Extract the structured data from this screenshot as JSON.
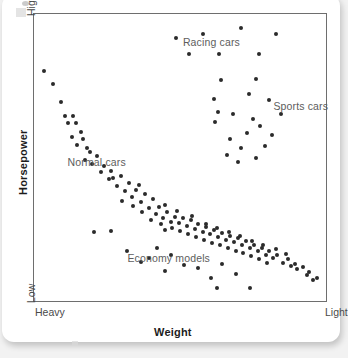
{
  "figure": {
    "caption_title": "Weight",
    "axis_titles": {
      "x": "Weight",
      "y": "Horsepower"
    },
    "axis_ends": {
      "x_left": "Heavy",
      "x_right": "Light",
      "y_top": "High",
      "y_bottom": "Low"
    }
  },
  "chart_data": {
    "type": "scatter",
    "title": "",
    "xlabel": "Weight",
    "ylabel": "Horsepower",
    "xlim": [
      0,
      100
    ],
    "ylim": [
      0,
      100
    ],
    "x_axis_direction": "Heavy (left) to Light (right)",
    "y_axis_direction": "Low (bottom) to High (top)",
    "x_tick_labels": [
      "Heavy",
      "Light"
    ],
    "y_tick_labels": [
      "Low",
      "High"
    ],
    "grid": false,
    "legend": "none",
    "annotations": [
      {
        "text": "Racing cars",
        "x": 51.0,
        "y": 90.0
      },
      {
        "text": "Sports cars",
        "x": 82.0,
        "y": 67.5
      },
      {
        "text": "Normal cars",
        "x": 11.5,
        "y": 48.0
      },
      {
        "text": "Economy models",
        "x": 32.0,
        "y": 14.5
      }
    ],
    "series": [
      {
        "name": "Normal cars",
        "comment": "Dense negatively-sloped diagonal band from heavy/high to light/low",
        "points": [
          [
            3.4,
            80.3
          ],
          [
            6.5,
            75.6
          ],
          [
            9.2,
            69.2
          ],
          [
            10.5,
            64.4
          ],
          [
            11.6,
            61.9
          ],
          [
            13.3,
            64.4
          ],
          [
            14.2,
            61.9
          ],
          [
            13.1,
            57.1
          ],
          [
            14.6,
            54.2
          ],
          [
            16.7,
            56.5
          ],
          [
            19.0,
            51.9
          ],
          [
            17.4,
            49.0
          ],
          [
            20.0,
            47.8
          ],
          [
            21.5,
            50.4
          ],
          [
            22.9,
            45.0
          ],
          [
            24.0,
            47.0
          ],
          [
            25.5,
            42.5
          ],
          [
            26.4,
            45.2
          ],
          [
            28.4,
            40.0
          ],
          [
            29.8,
            43.6
          ],
          [
            31.1,
            38.3
          ],
          [
            32.4,
            41.0
          ],
          [
            30.0,
            35.0
          ],
          [
            33.5,
            36.2
          ],
          [
            35.0,
            38.8
          ],
          [
            34.0,
            33.0
          ],
          [
            36.6,
            34.5
          ],
          [
            38.1,
            37.2
          ],
          [
            37.0,
            31.0
          ],
          [
            39.2,
            32.5
          ],
          [
            40.6,
            35.4
          ],
          [
            41.8,
            30.2
          ],
          [
            39.9,
            28.4
          ],
          [
            42.9,
            32.9
          ],
          [
            44.2,
            29.1
          ],
          [
            43.4,
            26.7
          ],
          [
            45.6,
            31.0
          ],
          [
            46.9,
            27.6
          ],
          [
            45.0,
            24.9
          ],
          [
            48.2,
            29.4
          ],
          [
            47.4,
            25.6
          ],
          [
            49.5,
            27.1
          ],
          [
            50.9,
            29.0
          ],
          [
            50.1,
            24.4
          ],
          [
            52.3,
            26.0
          ],
          [
            53.6,
            28.1
          ],
          [
            52.8,
            23.3
          ],
          [
            55.0,
            25.2
          ],
          [
            56.3,
            26.9
          ],
          [
            55.4,
            22.2
          ],
          [
            57.7,
            24.1
          ],
          [
            59.0,
            25.9
          ],
          [
            58.2,
            21.3
          ],
          [
            60.4,
            23.2
          ],
          [
            61.7,
            24.8
          ],
          [
            60.9,
            20.4
          ],
          [
            63.1,
            22.3
          ],
          [
            64.4,
            23.8
          ],
          [
            63.6,
            19.6
          ],
          [
            65.8,
            21.4
          ],
          [
            67.1,
            22.8
          ],
          [
            66.3,
            18.5
          ],
          [
            68.5,
            20.5
          ],
          [
            69.8,
            21.8
          ],
          [
            69.0,
            17.6
          ],
          [
            71.2,
            19.4
          ],
          [
            72.5,
            20.8
          ],
          [
            71.7,
            16.6
          ],
          [
            73.9,
            18.4
          ],
          [
            75.2,
            19.7
          ],
          [
            74.4,
            15.6
          ],
          [
            76.6,
            17.3
          ],
          [
            77.9,
            18.6
          ],
          [
            77.1,
            14.6
          ],
          [
            79.3,
            16.2
          ],
          [
            80.6,
            17.4
          ],
          [
            79.8,
            13.4
          ],
          [
            82.0,
            15.0
          ],
          [
            83.3,
            16.2
          ],
          [
            85.4,
            13.4
          ],
          [
            86.8,
            14.6
          ],
          [
            88.1,
            12.2
          ],
          [
            89.4,
            13.0
          ],
          [
            90.1,
            11.0
          ],
          [
            92.2,
            12.0
          ],
          [
            93.5,
            9.0
          ],
          [
            94.3,
            10.2
          ],
          [
            95.5,
            7.5
          ],
          [
            97.0,
            8.2
          ],
          [
            16.0,
            58.8
          ],
          [
            18.0,
            53.5
          ],
          [
            27.2,
            43.0
          ],
          [
            36.0,
            40.5
          ],
          [
            44.8,
            33.4
          ],
          [
            48.8,
            31.5
          ],
          [
            54.2,
            29.8
          ],
          [
            58.8,
            27.0
          ],
          [
            62.5,
            25.4
          ],
          [
            66.9,
            24.0
          ],
          [
            70.5,
            22.5
          ],
          [
            74.8,
            21.0
          ],
          [
            78.5,
            19.5
          ],
          [
            82.9,
            18.0
          ],
          [
            86.2,
            16.5
          ]
        ]
      },
      {
        "name": "Racing cars",
        "comment": "High horsepower cluster near the top of the plot",
        "points": [
          [
            48.5,
            91.5
          ],
          [
            57.7,
            93.2
          ],
          [
            70.8,
            95.0
          ],
          [
            83.0,
            93.2
          ],
          [
            53.0,
            86.0
          ],
          [
            63.5,
            86.0
          ],
          [
            77.0,
            86.0
          ]
        ]
      },
      {
        "name": "Sports cars",
        "comment": "Light-weight, high-horsepower cluster on the right",
        "points": [
          [
            64.0,
            77.0
          ],
          [
            76.0,
            77.5
          ],
          [
            61.5,
            70.5
          ],
          [
            73.5,
            72.0
          ],
          [
            80.5,
            70.0
          ],
          [
            63.0,
            66.0
          ],
          [
            68.0,
            65.0
          ],
          [
            62.0,
            62.5
          ],
          [
            75.0,
            63.5
          ],
          [
            84.5,
            65.0
          ],
          [
            77.5,
            61.0
          ],
          [
            73.0,
            58.5
          ],
          [
            81.5,
            58.0
          ],
          [
            67.0,
            56.5
          ],
          [
            71.0,
            53.5
          ],
          [
            79.0,
            54.0
          ],
          [
            66.0,
            51.0
          ],
          [
            70.0,
            48.5
          ],
          [
            76.0,
            50.0
          ]
        ]
      },
      {
        "name": "Economy models",
        "comment": "Low horsepower scatter below the main band",
        "points": [
          [
            20.5,
            24.0
          ],
          [
            26.5,
            24.5
          ],
          [
            32.0,
            17.5
          ],
          [
            42.0,
            18.5
          ],
          [
            36.5,
            13.5
          ],
          [
            39.5,
            15.0
          ],
          [
            47.0,
            16.0
          ],
          [
            51.5,
            12.5
          ],
          [
            45.0,
            10.5
          ],
          [
            56.0,
            11.5
          ],
          [
            60.5,
            8.0
          ],
          [
            64.5,
            13.0
          ],
          [
            69.0,
            9.5
          ],
          [
            62.5,
            4.5
          ],
          [
            74.0,
            4.5
          ]
        ]
      }
    ]
  }
}
